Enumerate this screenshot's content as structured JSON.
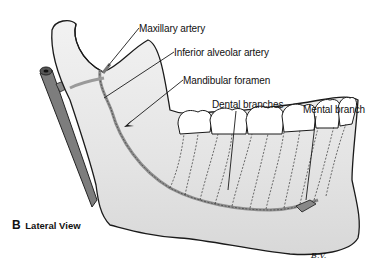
{
  "figure": {
    "panel_letter": "B",
    "panel_title": "Lateral View",
    "artist_signature": "B.V.",
    "labels": [
      {
        "id": "maxillary-artery",
        "text": "Maxillary artery",
        "x": 139,
        "y": 23
      },
      {
        "id": "inferior-alveolar-artery",
        "text": "Inferior alveolar artery",
        "x": 174,
        "y": 47
      },
      {
        "id": "mandibular-foramen",
        "text": "Mandibular foramen",
        "x": 183,
        "y": 75
      },
      {
        "id": "dental-branches",
        "text": "Dental branches",
        "x": 212,
        "y": 99
      },
      {
        "id": "mental-branch",
        "text": "Mental branch",
        "x": 303,
        "y": 104
      }
    ],
    "colors": {
      "bone_fill": "#ececec",
      "bone_shade": "#d4d4d4",
      "outline": "#1a1a1a",
      "artery": "#9a9a9a",
      "carotid": "#7d7d7d",
      "tooth": "#ffffff"
    }
  }
}
